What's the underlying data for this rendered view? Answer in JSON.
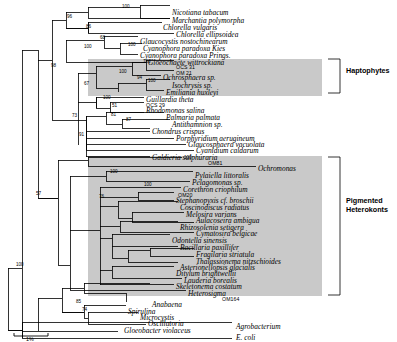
{
  "figure": {
    "kind": "phylogenetic-tree",
    "scale_bar_label": "1%"
  },
  "group_labels": [
    {
      "id": "haptophytes",
      "text": "Haptophytes",
      "x": 346,
      "y": 66
    },
    {
      "id": "pigmented-heterokonts",
      "line1": "Pigmented",
      "line2": "Heterokonts",
      "x": 346,
      "y": 196
    }
  ],
  "taxa": [
    {
      "id": "nicotiana-tabacum",
      "label": "Nicotiana tabacum",
      "x": 172,
      "y": 9,
      "style": "italic"
    },
    {
      "id": "marchantia-polymorpha",
      "label": "Marchantia polymorpha",
      "x": 172,
      "y": 17,
      "style": "italic"
    },
    {
      "id": "chlorella-vulgaris",
      "label": "Chlorella vulgaris",
      "x": 163,
      "y": 24,
      "style": "italic"
    },
    {
      "id": "chlorella-ellipsoidea",
      "label": "Chlorella ellipsoidea",
      "x": 176,
      "y": 31,
      "style": "italic"
    },
    {
      "id": "glaucocystis-nostochinearum",
      "label": "Glaucocystis nostochinearum",
      "x": 140,
      "y": 38,
      "style": "italic"
    },
    {
      "id": "cyanophora-paradoxa-kies",
      "label": "Cyanophora paradoxa Kies",
      "x": 143,
      "y": 45,
      "style": "italic"
    },
    {
      "id": "cyanophora-paradoxa-prings",
      "label": "Cyanophora paradoxa Prings.",
      "x": 140,
      "y": 52,
      "style": "italic"
    },
    {
      "id": "gloeochaete-wittrockiana",
      "label": "Gloeochaete wittrockiana",
      "x": 148,
      "y": 59,
      "style": "italic"
    },
    {
      "id": "ocs-31",
      "label": "OCS 31",
      "x": 176,
      "y": 63,
      "style": "upright"
    },
    {
      "id": "om-21",
      "label": "OM 21",
      "x": 176,
      "y": 69,
      "style": "upright"
    },
    {
      "id": "ochrosphaera-sp",
      "label": "Ochrosphaera sp.",
      "x": 163,
      "y": 74,
      "style": "italic"
    },
    {
      "id": "isochrysis-sp",
      "label": "Isochrysis sp.",
      "x": 172,
      "y": 82,
      "style": "italic"
    },
    {
      "id": "emiliania-huxleyi",
      "label": "Emiliania huxleyi",
      "x": 166,
      "y": 89,
      "style": "italic"
    },
    {
      "id": "guillardia-theta",
      "label": "Guillardia theta",
      "x": 146,
      "y": 96,
      "style": "italic"
    },
    {
      "id": "ocs-29",
      "label": "OCS 29",
      "x": 146,
      "y": 101,
      "style": "upright"
    },
    {
      "id": "rhodomonas-salina",
      "label": "Rhodomonas salina",
      "x": 146,
      "y": 107,
      "style": "italic"
    },
    {
      "id": "palmaria-palmata",
      "label": "Palmaria palmata",
      "x": 166,
      "y": 114,
      "style": "italic"
    },
    {
      "id": "antithamnion-sp",
      "label": "Antithamnion sp.",
      "x": 172,
      "y": 121,
      "style": "italic"
    },
    {
      "id": "chondrus-crispus",
      "label": "Chondrus crispus",
      "x": 152,
      "y": 128,
      "style": "italic"
    },
    {
      "id": "porphyridium-aerugineum",
      "label": "Porphyridium aerugineum",
      "x": 176,
      "y": 135,
      "style": "italic"
    },
    {
      "id": "glaucosphaera-vacuolata",
      "label": "Glaucosphaera vacuolata",
      "x": 188,
      "y": 141,
      "style": "italic"
    },
    {
      "id": "cyanidium-caldarum",
      "label": "Cyanidium caldarum",
      "x": 196,
      "y": 147,
      "style": "italic"
    },
    {
      "id": "galdieria-sulphuraria",
      "label": "Galdieria sulphuraria",
      "x": 152,
      "y": 154,
      "style": "italic"
    },
    {
      "id": "om81",
      "label": "OM81",
      "x": 208,
      "y": 159,
      "style": "upright"
    },
    {
      "id": "ochromonas",
      "label": "Ochromonas",
      "x": 258,
      "y": 165,
      "style": "italic"
    },
    {
      "id": "pylaiella-littoralis",
      "label": "Pylaiella littoralis",
      "x": 195,
      "y": 172,
      "style": "italic"
    },
    {
      "id": "pelagomonas-sp",
      "label": "Pelagomonas sp.",
      "x": 192,
      "y": 179,
      "style": "italic"
    },
    {
      "id": "corethron-criophilum",
      "label": "Corethron criophilum",
      "x": 183,
      "y": 186,
      "style": "italic"
    },
    {
      "id": "om20",
      "label": "OM20",
      "x": 178,
      "y": 191,
      "style": "upright"
    },
    {
      "id": "stephanopyxis-cf-broschii",
      "label": "Stephanopyxis cf. broschii",
      "x": 176,
      "y": 197,
      "style": "italic"
    },
    {
      "id": "coscinodiscus-radiatus",
      "label": "Coscinodiscus radiatus",
      "x": 180,
      "y": 204,
      "style": "italic"
    },
    {
      "id": "melosira-varians",
      "label": "Melosira varians",
      "x": 186,
      "y": 211,
      "style": "italic"
    },
    {
      "id": "aulacoseira-ambigua",
      "label": "Aulacoseira ambigua",
      "x": 196,
      "y": 217,
      "style": "italic"
    },
    {
      "id": "rhizosolenia-setigera",
      "label": "Rhizosolenia setigera",
      "x": 180,
      "y": 224,
      "style": "italic"
    },
    {
      "id": "cymatosira-belgicae",
      "label": "Cymatosira belgicae",
      "x": 196,
      "y": 230,
      "style": "italic"
    },
    {
      "id": "odontella-sinensis",
      "label": "Odontella sinensis",
      "x": 172,
      "y": 237,
      "style": "italic"
    },
    {
      "id": "bacillaria-paxillifer",
      "label": "Bacillaria paxillifer",
      "x": 180,
      "y": 244,
      "style": "italic"
    },
    {
      "id": "fragilaria-striatula",
      "label": "Fragilaria striatula",
      "x": 196,
      "y": 251,
      "style": "italic"
    },
    {
      "id": "thalassionema-nitzschioides",
      "label": "Thalassionema nitzschioides",
      "x": 196,
      "y": 258,
      "style": "italic"
    },
    {
      "id": "asterionellopsis-glacialis",
      "label": "Asterionellopsis glacialis",
      "x": 180,
      "y": 264,
      "style": "italic"
    },
    {
      "id": "ditylum-brightwellii",
      "label": "Ditylum brightwellii",
      "x": 176,
      "y": 270,
      "style": "italic"
    },
    {
      "id": "lauderia-borealis",
      "label": "Lauderia borealis",
      "x": 184,
      "y": 277,
      "style": "italic"
    },
    {
      "id": "skeletonema-costatum",
      "label": "Skeletonema costatum",
      "x": 176,
      "y": 283,
      "style": "italic"
    },
    {
      "id": "heterosigma",
      "label": "Heterosigma",
      "x": 188,
      "y": 290,
      "style": "italic"
    },
    {
      "id": "om164",
      "label": "OM164",
      "x": 222,
      "y": 295,
      "style": "upright"
    },
    {
      "id": "anabaena",
      "label": "Anabaena",
      "x": 152,
      "y": 301,
      "style": "italic"
    },
    {
      "id": "spirulina",
      "label": "Spirulina",
      "x": 128,
      "y": 308,
      "style": "italic"
    },
    {
      "id": "microcystis",
      "label": "Microcystis",
      "x": 140,
      "y": 314,
      "style": "italic"
    },
    {
      "id": "oscillatoria",
      "label": "Oscillatoria",
      "x": 148,
      "y": 320,
      "style": "italic"
    },
    {
      "id": "gloeobacter-violaceus",
      "label": "Gloeobacter violaceus",
      "x": 124,
      "y": 327,
      "style": "italic"
    },
    {
      "id": "agrobacterium",
      "label": "Agrobacterium",
      "x": 236,
      "y": 323,
      "style": "italic"
    },
    {
      "id": "e-coli",
      "label": "E. coli",
      "x": 236,
      "y": 334,
      "style": "italic"
    }
  ],
  "bootstrap_values": [
    {
      "id": "b-100-top",
      "value": "100",
      "x": 122,
      "y": 4
    },
    {
      "id": "b-96-seedplants",
      "value": "96",
      "x": 67,
      "y": 14
    },
    {
      "id": "b-86-chlorella",
      "value": "86",
      "x": 86,
      "y": 24
    },
    {
      "id": "b-68-glauco",
      "value": "68",
      "x": 100,
      "y": 35
    },
    {
      "id": "b-100-cyanophora",
      "value": "100",
      "x": 128,
      "y": 42
    },
    {
      "id": "b-100-glauco-cl",
      "value": "100",
      "x": 84,
      "y": 44
    },
    {
      "id": "b-98-left",
      "value": "98",
      "x": 51,
      "y": 63
    },
    {
      "id": "b-100-ocs31",
      "value": "100",
      "x": 143,
      "y": 59
    },
    {
      "id": "b-100-hapto",
      "value": "100",
      "x": 119,
      "y": 69
    },
    {
      "id": "b-94-hapto",
      "value": "94",
      "x": 137,
      "y": 75
    },
    {
      "id": "b-100-isochrysis",
      "value": "100",
      "x": 148,
      "y": 78
    },
    {
      "id": "b-67-crypto",
      "value": "67",
      "x": 84,
      "y": 81
    },
    {
      "id": "b-100-guillardia",
      "value": "100",
      "x": 103,
      "y": 95
    },
    {
      "id": "b-51-rhodo",
      "value": "51",
      "x": 112,
      "y": 103
    },
    {
      "id": "b-81-palmaria",
      "value": "81",
      "x": 111,
      "y": 112
    },
    {
      "id": "b-87-antitham",
      "value": "87",
      "x": 126,
      "y": 117
    },
    {
      "id": "b-73-red",
      "value": "73",
      "x": 72,
      "y": 113
    },
    {
      "id": "b-91-red",
      "value": "91",
      "x": 79,
      "y": 132
    },
    {
      "id": "b-100-galdieria",
      "value": "100",
      "x": 184,
      "y": 155
    },
    {
      "id": "b-57-left",
      "value": "57",
      "x": 36,
      "y": 191
    },
    {
      "id": "b-100-pylaiella",
      "value": "100",
      "x": 110,
      "y": 169
    },
    {
      "id": "b-100-diatoms",
      "value": "100",
      "x": 144,
      "y": 182
    },
    {
      "id": "b-76-heterokont",
      "value": "76",
      "x": 99,
      "y": 194
    },
    {
      "id": "b-100-bottom",
      "value": "100",
      "x": 16,
      "y": 262
    },
    {
      "id": "b-85-cyano",
      "value": "85",
      "x": 76,
      "y": 299
    },
    {
      "id": "b-74-cyano",
      "value": "74",
      "x": 82,
      "y": 307
    }
  ],
  "shaded_regions": [
    {
      "id": "haptophyte-shade",
      "x": 88,
      "y": 59,
      "w": 234,
      "h": 37
    },
    {
      "id": "heterokont-shade",
      "x": 88,
      "y": 156,
      "w": 234,
      "h": 140
    }
  ]
}
